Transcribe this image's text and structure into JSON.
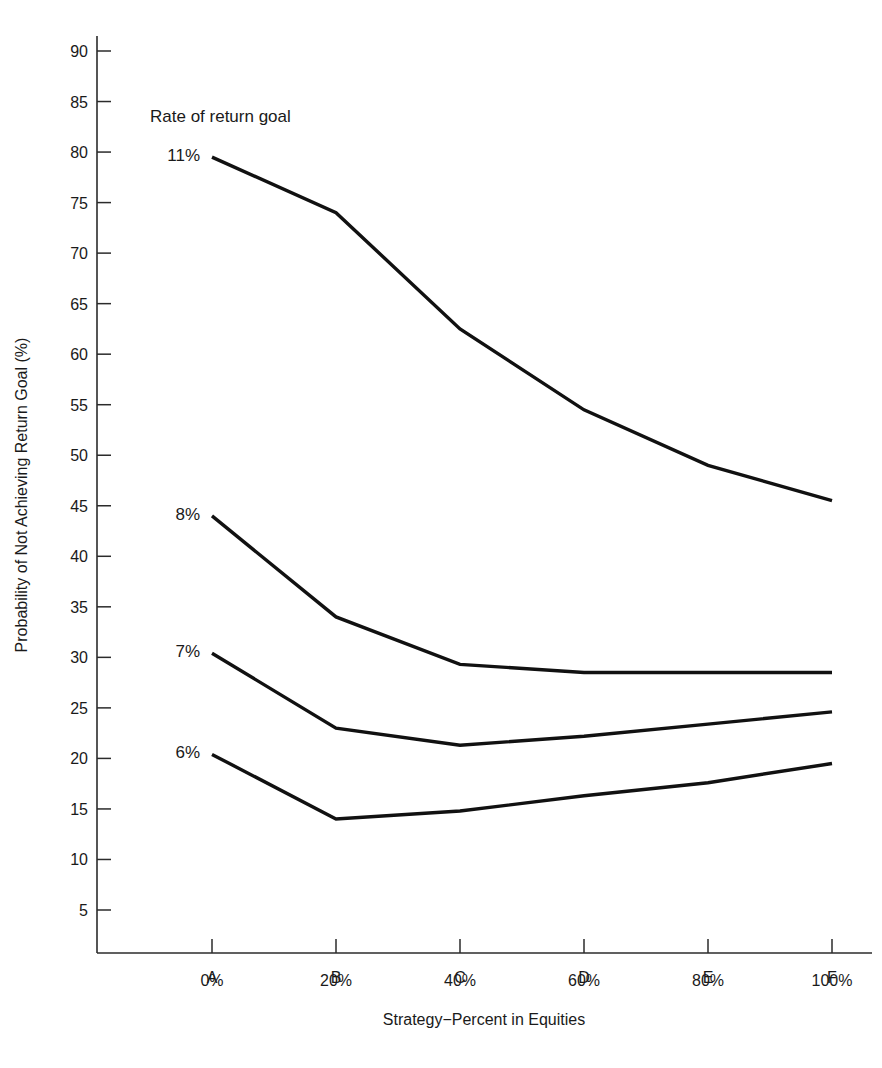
{
  "chart_data": {
    "type": "line",
    "title": "",
    "xlabel": "Strategy−Percent in Equities",
    "ylabel": "Probability of Not Achieving Return Goal (%)",
    "categories": [
      "A",
      "B",
      "C",
      "D",
      "E",
      "F"
    ],
    "category_sublabels": [
      "0%",
      "20%",
      "40%",
      "60%",
      "80%",
      "100%"
    ],
    "annotation": "Rate of return goal",
    "ylim": [
      0,
      92
    ],
    "yticks": [
      5,
      10,
      15,
      20,
      25,
      30,
      35,
      40,
      45,
      50,
      55,
      60,
      65,
      70,
      75,
      80,
      85,
      90
    ],
    "ytick_labels": [
      "5",
      "10",
      "15",
      "20",
      "25",
      "30",
      "35",
      "40",
      "45",
      "50",
      "55",
      "60",
      "65",
      "70",
      "75",
      "80",
      "85",
      "90"
    ],
    "grid": false,
    "legend_position": "inline-left-labels",
    "line_color": "#111111",
    "series": [
      {
        "name": "11%",
        "label": "11%",
        "values": [
          79.5,
          74.0,
          62.5,
          54.5,
          49.0,
          45.5
        ]
      },
      {
        "name": "8%",
        "label": "8%",
        "values": [
          44.0,
          34.0,
          29.3,
          28.5,
          28.5,
          28.5
        ]
      },
      {
        "name": "7%",
        "label": "7%",
        "values": [
          30.4,
          23.0,
          21.3,
          22.2,
          23.4,
          24.6
        ]
      },
      {
        "name": "6%",
        "label": "6%",
        "values": [
          20.4,
          14.0,
          14.8,
          16.3,
          17.6,
          19.5
        ]
      }
    ]
  },
  "axis": {
    "y_title": "Probability of Not Achieving Return Goal (%)",
    "x_title": "Strategy−Percent in Equities"
  },
  "annotations": {
    "rate_of_return_goal": "Rate of return goal"
  }
}
